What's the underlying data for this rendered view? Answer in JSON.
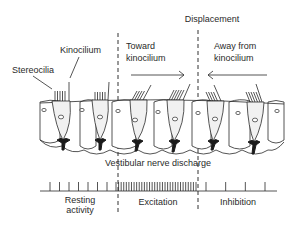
{
  "title": "Displacement",
  "labels": {
    "kinocilium": "Kinocilium",
    "stereocilia": "Stereocilia",
    "toward_line1": "Toward",
    "toward_line2": "kinocilium",
    "away_line1": "Away from",
    "away_line2": "kinocilium",
    "nerve_discharge": "Vestibular nerve discharge",
    "resting_line1": "Resting",
    "resting_line2": "activity",
    "excitation": "Excitation",
    "inhibition": "Inhibition"
  },
  "arrows": {
    "toward": {
      "direction": "right",
      "icon": "arrow-right-icon"
    },
    "away": {
      "direction": "left",
      "icon": "arrow-left-icon"
    }
  },
  "spike_train": {
    "resting_count": 7,
    "excitation_count": 32,
    "inhibition_count": 4
  },
  "hair_cells": [
    {
      "x": 64,
      "bundle": "upright"
    },
    {
      "x": 100,
      "bundle": "upright"
    },
    {
      "x": 140,
      "bundle": "tilted-right"
    },
    {
      "x": 177,
      "bundle": "tilted-right"
    },
    {
      "x": 215,
      "bundle": "tilted-left"
    },
    {
      "x": 255,
      "bundle": "tilted-left"
    }
  ],
  "colors": {
    "ink": "#2a2a2a",
    "cell_fill": "#f1f1f1",
    "background": "#ffffff"
  }
}
